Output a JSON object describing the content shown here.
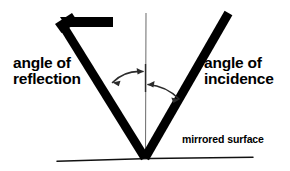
{
  "diagram": {
    "background_color": "#ffffff",
    "ink_color": "#000000",
    "normal_line_color": "#555555",
    "labels": {
      "reflection_line1": "angle of",
      "reflection_line2": "reflection",
      "incidence_line1": "angle of",
      "incidence_line2": "incidence",
      "mirror_surface": "mirrored surface"
    },
    "elements": {
      "reflected_ray_name": "reflected-ray",
      "incident_ray_name": "incident-ray",
      "normal_name": "normal-line",
      "mirror_name": "mirror-surface-line",
      "reflection_arc_name": "reflection-angle-arc",
      "incidence_arc_name": "incidence-angle-arc",
      "arrowhead_name": "ray-direction-arrowhead"
    },
    "geometry": {
      "vertex_x": 145,
      "vertex_y": 158,
      "reflected_ray_tip_x": 58,
      "reflected_ray_tip_y": 25,
      "incident_ray_top_x": 229,
      "incident_ray_top_y": 12,
      "normal_top_y": 13,
      "mirror_left_x": 57,
      "mirror_right_x": 253,
      "mirror_y": 159
    }
  }
}
